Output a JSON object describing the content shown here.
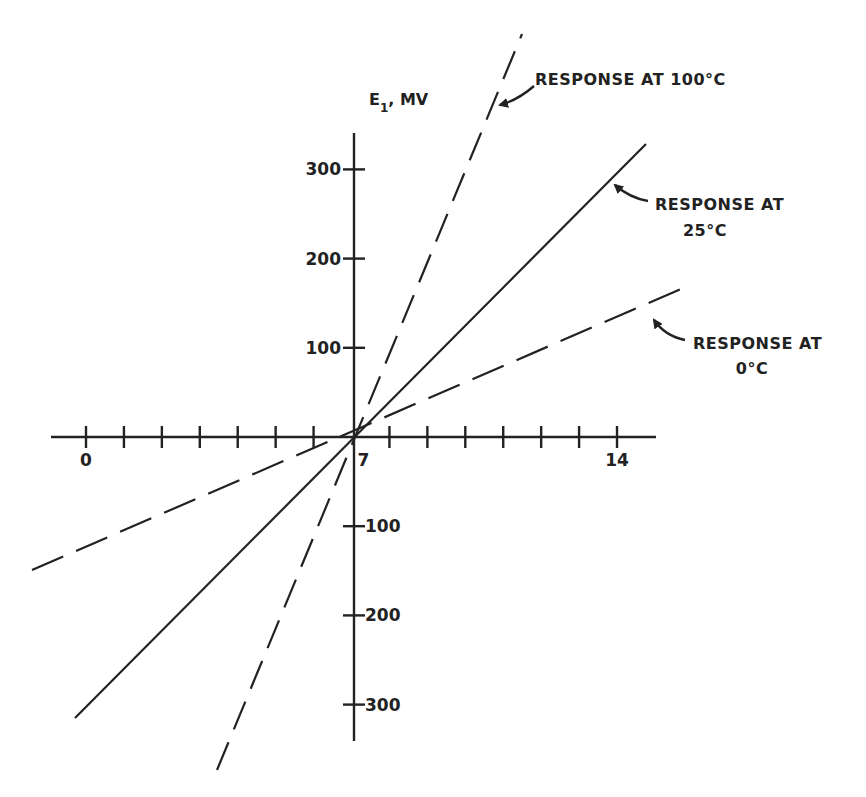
{
  "chart_data": {
    "type": "line",
    "title": "",
    "xlabel": "",
    "ylabel": "E1, MV",
    "ylabel_main": "E",
    "ylabel_sub": "1",
    "ylabel_rest": ", MV",
    "x_ticks": [
      0,
      1,
      2,
      3,
      4,
      5,
      6,
      7,
      8,
      9,
      10,
      11,
      12,
      13,
      14
    ],
    "x_tick_labels": [
      {
        "value": 0,
        "label": "0"
      },
      {
        "value": 7,
        "label": "7"
      },
      {
        "value": 14,
        "label": "14"
      }
    ],
    "y_tick_labels": [
      {
        "value": 300,
        "label": "300"
      },
      {
        "value": 200,
        "label": "200"
      },
      {
        "value": 100,
        "label": "100"
      },
      {
        "value": -100,
        "label": "100"
      },
      {
        "value": -200,
        "label": "200"
      },
      {
        "value": -300,
        "label": "300"
      }
    ],
    "xlim": [
      -1.5,
      15
    ],
    "ylim": [
      -340,
      340
    ],
    "grid": false,
    "legend": "inline annotations with arrows",
    "origin": {
      "x": 7,
      "y": 0
    },
    "series": [
      {
        "name": "Response at 100°C",
        "style": "dashed",
        "x": [
          3.3,
          7,
          11.6
        ],
        "y": [
          -375,
          0,
          453
        ],
        "label_lines": [
          "RESPONSE AT 100°C"
        ]
      },
      {
        "name": "Response at 25°C",
        "style": "solid",
        "x": [
          0.1,
          7,
          14.7
        ],
        "y": [
          -316,
          0,
          329
        ],
        "label_lines": [
          "RESPONSE AT",
          "25°C"
        ]
      },
      {
        "name": "Response at 0°C",
        "style": "dashed",
        "x": [
          -1.4,
          7,
          15.9
        ],
        "y": [
          -149,
          0,
          171
        ],
        "label_lines": [
          "RESPONSE AT",
          "0°C"
        ]
      }
    ]
  }
}
